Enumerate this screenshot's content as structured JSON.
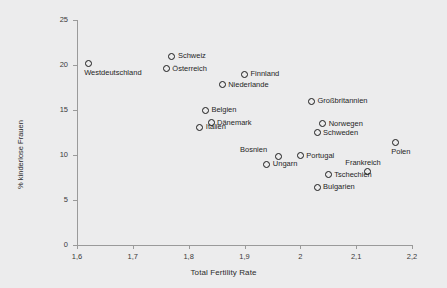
{
  "chart_data": {
    "type": "scatter",
    "title": "",
    "xlabel": "Total Fertility Rate",
    "ylabel": "% kinderlose Frauen",
    "xlim": [
      1.6,
      2.2
    ],
    "ylim": [
      0,
      25
    ],
    "xticks": [
      "1,6",
      "1,7",
      "1,8",
      "1,9",
      "2",
      "2,1",
      "2,2"
    ],
    "xtick_values": [
      1.6,
      1.7,
      1.8,
      1.9,
      2.0,
      2.1,
      2.2
    ],
    "yticks": [
      "0",
      "5",
      "10",
      "15",
      "20",
      "25"
    ],
    "ytick_values": [
      0,
      5,
      10,
      15,
      20,
      25
    ],
    "grid": false,
    "legend": false,
    "marker": "open-circle",
    "marker_color": "#1a1a1a",
    "background_color": "#ececed",
    "axis_color": "#9a9a9a",
    "points": [
      {
        "label": "Westdeutschland",
        "x": 1.62,
        "y": 20.2,
        "label_pos": "below"
      },
      {
        "label": "Schweiz",
        "x": 1.77,
        "y": 21.0,
        "label_pos": "right"
      },
      {
        "label": "Österreich",
        "x": 1.76,
        "y": 19.6,
        "label_pos": "right"
      },
      {
        "label": "Finnland",
        "x": 1.9,
        "y": 19.0,
        "label_pos": "right"
      },
      {
        "label": "Niederlande",
        "x": 1.86,
        "y": 17.8,
        "label_pos": "right"
      },
      {
        "label": "Belgien",
        "x": 1.83,
        "y": 15.0,
        "label_pos": "right"
      },
      {
        "label": "Dänemark",
        "x": 1.84,
        "y": 13.6,
        "label_pos": "right"
      },
      {
        "label": "Italien",
        "x": 1.82,
        "y": 13.1,
        "label_pos": "right"
      },
      {
        "label": "Großbritannien",
        "x": 2.02,
        "y": 16.0,
        "label_pos": "right"
      },
      {
        "label": "Norwegen",
        "x": 2.04,
        "y": 13.5,
        "label_pos": "right"
      },
      {
        "label": "Schweden",
        "x": 2.03,
        "y": 12.5,
        "label_pos": "right"
      },
      {
        "label": "Polen",
        "x": 2.17,
        "y": 11.4,
        "label_pos": "below"
      },
      {
        "label": "Bosnien",
        "x": 1.96,
        "y": 9.8,
        "label_pos": "above-left"
      },
      {
        "label": "Portugal",
        "x": 2.0,
        "y": 9.9,
        "label_pos": "right"
      },
      {
        "label": "Ungarn",
        "x": 1.94,
        "y": 9.0,
        "label_pos": "right"
      },
      {
        "label": "Frankreich",
        "x": 2.12,
        "y": 8.2,
        "label_pos": "above-right"
      },
      {
        "label": "Tschechien",
        "x": 2.05,
        "y": 7.8,
        "label_pos": "right"
      },
      {
        "label": "Bulgarien",
        "x": 2.03,
        "y": 6.4,
        "label_pos": "right"
      }
    ]
  }
}
